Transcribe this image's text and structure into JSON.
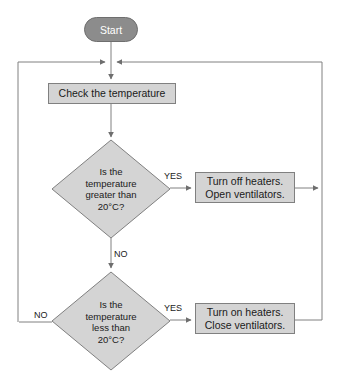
{
  "diagram": {
    "type": "flowchart",
    "colors": {
      "terminator_fill": "#8c8c8c",
      "terminator_text": "#ffffff",
      "node_fill": "#d4d4d4",
      "node_border": "#808080",
      "connector": "#808080",
      "text": "#1a1a1a",
      "background": "#ffffff"
    },
    "top_clip_text": "",
    "nodes": {
      "start": {
        "shape": "terminator",
        "label": "Start"
      },
      "check": {
        "shape": "process",
        "label": "Check the temperature"
      },
      "decision_1": {
        "shape": "decision",
        "line_1": "Is the",
        "line_2": "temperature",
        "line_3": "greater than",
        "line_4": "20°C?"
      },
      "action_hot": {
        "shape": "process",
        "line_1": "Turn off heaters.",
        "line_2": "Open ventilators."
      },
      "decision_2": {
        "shape": "decision",
        "line_1": "Is the",
        "line_2": "temperature",
        "line_3": "less than",
        "line_4": "20°C?"
      },
      "action_cold": {
        "shape": "process",
        "line_1": "Turn on heaters.",
        "line_2": "Close ventilators."
      }
    },
    "edges": {
      "yes_1": "YES",
      "no_1": "NO",
      "yes_2": "YES",
      "no_2": "NO"
    }
  }
}
